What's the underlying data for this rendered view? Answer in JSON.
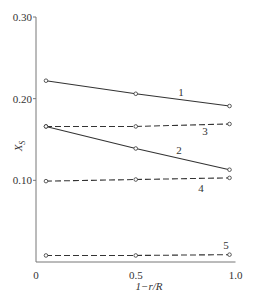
{
  "chart_data": {
    "type": "line",
    "title": "",
    "xlabel": "1−r/R",
    "ylabel": "X_S",
    "xlim": [
      0,
      1.0
    ],
    "ylim": [
      0,
      0.3
    ],
    "x_ticks": [
      "0",
      "0.5",
      "1.0"
    ],
    "y_ticks": [
      "0.10",
      "0.20",
      "0.30"
    ],
    "grid": false,
    "legend": "inline numeric labels on lines",
    "series": [
      {
        "name": "1",
        "style": "solid",
        "x": [
          0.05,
          0.5,
          0.97
        ],
        "values": [
          0.222,
          0.206,
          0.191
        ]
      },
      {
        "name": "2",
        "style": "solid",
        "x": [
          0.05,
          0.5,
          0.97
        ],
        "values": [
          0.166,
          0.139,
          0.113
        ]
      },
      {
        "name": "3",
        "style": "dashed",
        "x": [
          0.05,
          0.5,
          0.97
        ],
        "values": [
          0.166,
          0.166,
          0.169
        ]
      },
      {
        "name": "4",
        "style": "dashed",
        "x": [
          0.05,
          0.5,
          0.97
        ],
        "values": [
          0.099,
          0.101,
          0.103
        ]
      },
      {
        "name": "5",
        "style": "dashed",
        "x": [
          0.05,
          0.5,
          0.97
        ],
        "values": [
          0.008,
          0.008,
          0.009
        ]
      }
    ]
  }
}
